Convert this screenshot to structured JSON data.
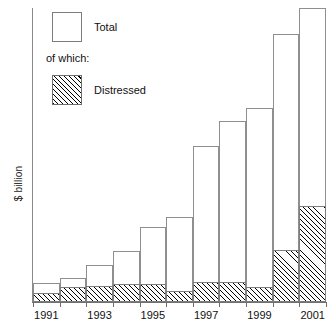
{
  "chart_data": {
    "type": "bar",
    "title": "",
    "subtitle": "",
    "xlabel": "",
    "ylabel": "$ billion",
    "grid": false,
    "stacked": true,
    "legend_position": "top-left",
    "categories": [
      "1991",
      "1992",
      "1993",
      "1994",
      "1995",
      "1996",
      "1997",
      "1998",
      "1999",
      "2000",
      "2001"
    ],
    "tick_labels": [
      "1991",
      "1993",
      "1995",
      "1997",
      "1999",
      "2001"
    ],
    "ylim": [
      0,
      10
    ],
    "series": [
      {
        "name": "Total",
        "values": [
          0.65,
          0.82,
          1.25,
          1.72,
          2.55,
          2.9,
          5.3,
          6.15,
          6.6,
          9.1,
          10.0
        ]
      },
      {
        "name": "Distressed",
        "values": [
          0.3,
          0.52,
          0.56,
          0.6,
          0.6,
          0.39,
          0.69,
          0.69,
          0.52,
          1.78,
          3.25
        ]
      }
    ],
    "annotations": [
      "of which:"
    ]
  },
  "axes": {
    "y_title": "$ billion",
    "x_tick_labels": [
      {
        "label": "1991",
        "center_pct": 4.5
      },
      {
        "label": "1993",
        "center_pct": 22.7
      },
      {
        "label": "1995",
        "center_pct": 40.9
      },
      {
        "label": "1997",
        "center_pct": 59.1
      },
      {
        "label": "1999",
        "center_pct": 77.3
      },
      {
        "label": "2001",
        "center_pct": 95.5
      }
    ]
  },
  "legend": {
    "total_label": "Total",
    "of_which_label": "of which:",
    "distressed_label": "Distressed"
  },
  "style": {
    "bar_outline": "#8f8f8f",
    "hatch_color": "#000000",
    "axis_color": "#6f6f6f",
    "background": "#ffffff"
  }
}
